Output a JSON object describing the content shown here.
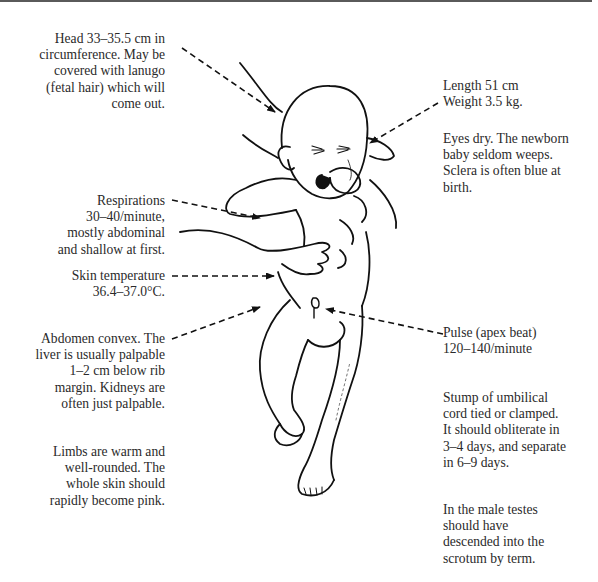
{
  "diagram": {
    "annotations": [
      {
        "id": "head",
        "side": "left",
        "lines": [
          "Head 33–35.5 cm in",
          "circumference. May be",
          "covered with lanugo",
          "(fetal hair) which will",
          "come out."
        ]
      },
      {
        "id": "length-weight",
        "side": "right",
        "lines": [
          "Length 51 cm",
          "Weight 3.5 kg."
        ]
      },
      {
        "id": "eyes",
        "side": "right",
        "lines": [
          "Eyes dry. The newborn",
          "baby seldom weeps.",
          "Sclera is often blue at",
          "birth."
        ]
      },
      {
        "id": "respirations",
        "side": "left",
        "lines": [
          "Respirations",
          "30–40/minute,",
          "mostly abdominal",
          "and shallow at first."
        ]
      },
      {
        "id": "skin-temperature",
        "side": "left",
        "lines": [
          "Skin temperature",
          "36.4–37.0°C."
        ]
      },
      {
        "id": "abdomen",
        "side": "left",
        "lines": [
          "Abdomen convex. The",
          "liver is usually palpable",
          "1–2 cm below rib",
          "margin. Kidneys are",
          "often just palpable."
        ]
      },
      {
        "id": "pulse",
        "side": "right",
        "lines": [
          "Pulse (apex beat)",
          "120–140/minute"
        ]
      },
      {
        "id": "limbs",
        "side": "left",
        "lines": [
          "Limbs are warm and",
          "well-rounded. The",
          "whole skin should",
          "rapidly become pink."
        ]
      },
      {
        "id": "umbilical-cord",
        "side": "right",
        "lines": [
          "Stump of umbilical",
          "cord tied or clamped.",
          "It should obliterate in",
          "3–4 days, and separate",
          "in 6–9 days."
        ]
      },
      {
        "id": "testes",
        "side": "right",
        "lines": [
          "In the male testes",
          "should have",
          "descended into the",
          "scrotum by term."
        ]
      }
    ]
  },
  "colors": {
    "text": "#2a2a2a",
    "line": "#111111",
    "rule": "#5a5a5a",
    "background": "#ffffff"
  }
}
